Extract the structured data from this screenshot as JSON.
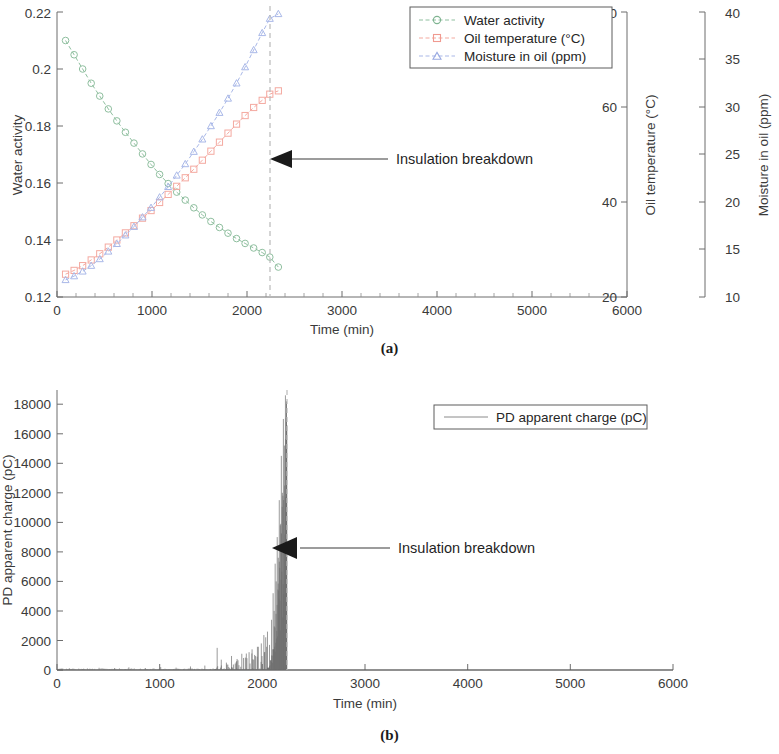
{
  "figure": {
    "panels": [
      {
        "id": "a",
        "caption": "(a)"
      },
      {
        "id": "b",
        "caption": "(b)"
      }
    ]
  },
  "panel_a": {
    "caption": "(a)",
    "xlabel": "Time (min)",
    "annotation": "Insulation breakdown",
    "legend": [
      {
        "label": "Water activity",
        "color": "#8fbf9f",
        "marker": "circle"
      },
      {
        "label": "Oil temperature (°C)",
        "color": "#f4a9a0",
        "marker": "square"
      },
      {
        "label": "Moisture in oil (ppm)",
        "color": "#a9b8e8",
        "marker": "triangle"
      }
    ],
    "axes": {
      "x": {
        "label": "Time (min)",
        "min": 0,
        "max": 6000,
        "ticks": [
          0,
          1000,
          2000,
          3000,
          4000,
          5000,
          6000
        ],
        "color": "#3a3a3a"
      },
      "y_left": {
        "label": "Water activity",
        "min": 0.12,
        "max": 0.22,
        "ticks": [
          "0.12",
          "0.14",
          "0.16",
          "0.18",
          "0.2",
          "0.22"
        ],
        "color": "#7aa98a"
      },
      "y_right_1": {
        "label": "Oil temperature (°C)",
        "min": 20,
        "max": 80,
        "ticks": [
          "20",
          "40",
          "60",
          "80"
        ],
        "color": "#f0867a"
      },
      "y_right_2": {
        "label": "Moisture in oil (ppm)",
        "min": 10,
        "max": 40,
        "ticks": [
          "10",
          "15",
          "20",
          "25",
          "30",
          "35",
          "40"
        ],
        "color": "#8d9fe0"
      }
    },
    "breakdown_time": 2240
  },
  "panel_b": {
    "caption": "(b)",
    "xlabel": "Time (min)",
    "annotation": "Insulation breakdown",
    "legend": [
      {
        "label": "PD apparent charge (pC)",
        "color": "#6e6e6e",
        "marker": "line"
      }
    ],
    "axes": {
      "x": {
        "label": "Time (min)",
        "min": 0,
        "max": 6000,
        "ticks": [
          0,
          1000,
          2000,
          3000,
          4000,
          5000,
          6000
        ],
        "color": "#3a3a3a"
      },
      "y": {
        "label": "PD apparent charge (pC)",
        "min": 0,
        "max": 19000,
        "ticks": [
          "0",
          "2000",
          "4000",
          "6000",
          "8000",
          "10000",
          "12000",
          "14000",
          "16000",
          "18000"
        ],
        "color": "#3a3a3a"
      }
    },
    "breakdown_time": 2240
  },
  "chart_data": [
    {
      "type": "line",
      "panel": "a",
      "title": "",
      "xlabel": "Time (min)",
      "ylabel": "Water activity",
      "xlim": [
        0,
        6000
      ],
      "ylim": [
        0.12,
        0.22
      ],
      "grid": false,
      "legend_position": "top-right",
      "annotations": [
        {
          "text": "Insulation breakdown",
          "x": 2240,
          "note": "arrow pointing to dashed breakdown line"
        }
      ],
      "x": [
        90,
        180,
        270,
        360,
        450,
        540,
        630,
        720,
        810,
        900,
        990,
        1080,
        1170,
        1260,
        1350,
        1440,
        1530,
        1620,
        1710,
        1800,
        1890,
        1980,
        2070,
        2160,
        2240,
        2330
      ],
      "series": [
        {
          "name": "Water activity",
          "axis": "y_left",
          "units": "",
          "color": "#8fbf9f",
          "marker": "circle",
          "values": [
            0.21,
            0.205,
            0.2,
            0.195,
            0.1905,
            0.186,
            0.1818,
            0.1778,
            0.174,
            0.1702,
            0.1665,
            0.163,
            0.1598,
            0.1568,
            0.154,
            0.1513,
            0.1488,
            0.1465,
            0.1444,
            0.1424,
            0.1405,
            0.1388,
            0.1372,
            0.1356,
            0.134,
            0.1305
          ]
        },
        {
          "name": "Oil temperature (°C)",
          "axis": "y_right_1",
          "units": "°C",
          "color": "#f4a9a0",
          "marker": "square",
          "values": [
            24.8,
            25.6,
            26.6,
            27.8,
            29.1,
            30.5,
            32.0,
            33.5,
            35.0,
            36.6,
            38.2,
            39.9,
            41.6,
            43.3,
            45.1,
            46.9,
            48.8,
            50.7,
            52.6,
            54.5,
            56.4,
            58.2,
            59.9,
            61.4,
            62.7,
            63.4
          ]
        },
        {
          "name": "Moisture in oil (ppm)",
          "axis": "y_right_2",
          "units": "ppm",
          "color": "#a9b8e8",
          "marker": "triangle",
          "values": [
            11.8,
            12.2,
            12.7,
            13.3,
            14.0,
            14.8,
            15.6,
            16.5,
            17.4,
            18.4,
            19.4,
            20.5,
            21.6,
            22.8,
            24.0,
            25.3,
            26.6,
            28.0,
            29.4,
            30.9,
            32.5,
            34.2,
            36.0,
            37.8,
            39.3,
            39.8
          ]
        }
      ]
    },
    {
      "type": "line",
      "panel": "b",
      "title": "",
      "xlabel": "Time (min)",
      "ylabel": "PD apparent charge (pC)",
      "xlim": [
        0,
        6000
      ],
      "ylim": [
        0,
        19000
      ],
      "grid": false,
      "legend_position": "top-right",
      "annotations": [
        {
          "text": "Insulation breakdown",
          "x": 2240,
          "note": "arrow pointing to dashed breakdown line"
        }
      ],
      "series": [
        {
          "name": "PD apparent charge (pC)",
          "color": "#6e6e6e",
          "description": "Near-zero baseline with sparse low spikes until ~1500 min, growing intermittent spikes 1550-2000 min, then a dense burst of very large discharges 2050-2240 min reaching above 18000 pC at the breakdown instant, after which the signal stops.",
          "spikes": [
            {
              "t": 120,
              "q": 120
            },
            {
              "t": 260,
              "q": 90
            },
            {
              "t": 410,
              "q": 150
            },
            {
              "t": 560,
              "q": 110
            },
            {
              "t": 700,
              "q": 180
            },
            {
              "t": 860,
              "q": 130
            },
            {
              "t": 1010,
              "q": 200
            },
            {
              "t": 1160,
              "q": 160
            },
            {
              "t": 1300,
              "q": 240
            },
            {
              "t": 1440,
              "q": 300
            },
            {
              "t": 1560,
              "q": 1500
            },
            {
              "t": 1600,
              "q": 700
            },
            {
              "t": 1650,
              "q": 500
            },
            {
              "t": 1700,
              "q": 950
            },
            {
              "t": 1750,
              "q": 600
            },
            {
              "t": 1800,
              "q": 1100
            },
            {
              "t": 1850,
              "q": 800
            },
            {
              "t": 1900,
              "q": 1400
            },
            {
              "t": 1950,
              "q": 900
            },
            {
              "t": 1990,
              "q": 1800
            },
            {
              "t": 2020,
              "q": 1200
            },
            {
              "t": 2050,
              "q": 2600
            },
            {
              "t": 2070,
              "q": 1700
            },
            {
              "t": 2090,
              "q": 3400
            },
            {
              "t": 2105,
              "q": 5200
            },
            {
              "t": 2115,
              "q": 4000
            },
            {
              "t": 2125,
              "q": 7200
            },
            {
              "t": 2135,
              "q": 6000
            },
            {
              "t": 2145,
              "q": 9000
            },
            {
              "t": 2155,
              "q": 7600
            },
            {
              "t": 2165,
              "q": 11500
            },
            {
              "t": 2175,
              "q": 9800
            },
            {
              "t": 2185,
              "q": 14500
            },
            {
              "t": 2195,
              "q": 12000
            },
            {
              "t": 2205,
              "q": 17000
            },
            {
              "t": 2215,
              "q": 15200
            },
            {
              "t": 2225,
              "q": 18600
            },
            {
              "t": 2235,
              "q": 18200
            }
          ]
        }
      ]
    }
  ]
}
